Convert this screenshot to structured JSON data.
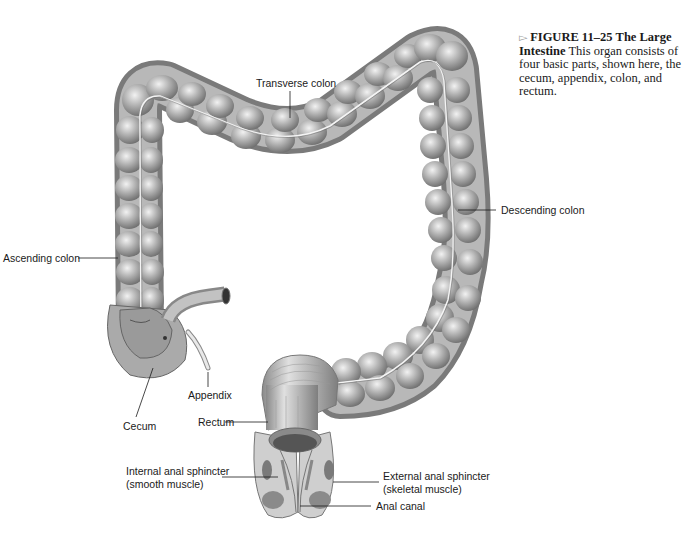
{
  "figure": {
    "marker": "▻",
    "number": "FIGURE  11–25",
    "title_a": "The",
    "title_b": "Large Intestine",
    "description": "This organ consists of four basic parts, shown here, the cecum, appendix, colon, and rectum."
  },
  "labels": {
    "transverse_colon": "Transverse colon",
    "ascending_colon": "Ascending colon",
    "descending_colon": "Descending colon",
    "cecum": "Cecum",
    "appendix": "Appendix",
    "rectum": "Rectum",
    "internal_sphincter_1": "Internal anal sphincter",
    "internal_sphincter_2": "(smooth muscle)",
    "external_sphincter_1": "External anal sphincter",
    "external_sphincter_2": "(skeletal muscle)",
    "anal_canal": "Anal canal"
  },
  "colors": {
    "tissue_dark": "#6e6e6e",
    "tissue_mid": "#a8a8a8",
    "tissue_light": "#e2e2e2",
    "text": "#1a1a1a"
  }
}
